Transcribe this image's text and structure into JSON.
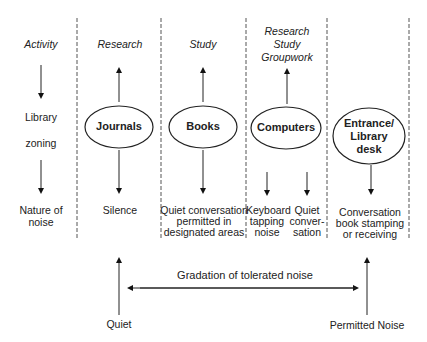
{
  "diagram": {
    "row_labels": {
      "activity": "Activity",
      "library": "Library",
      "zoning": "zoning",
      "nature_of": "Nature of",
      "noise": "noise"
    },
    "columns": [
      {
        "activity": "Research",
        "zone": "Journals",
        "noise": [
          "Silence"
        ]
      },
      {
        "activity": "Study",
        "zone": "Books",
        "noise": [
          "Quiet conversation",
          "permitted in",
          "designated areas"
        ]
      },
      {
        "activity": [
          "Research",
          "Study",
          "Groupwork"
        ],
        "zone": "Computers",
        "noise_a": [
          "Keyboard",
          "tapping",
          "noise"
        ],
        "noise_b": [
          "Quiet",
          "conver-",
          "sation"
        ]
      },
      {
        "zone": [
          "Entrance/",
          "Library",
          "desk"
        ],
        "noise": [
          "Conversation",
          "book stamping",
          "or receiving"
        ]
      }
    ],
    "gradation": {
      "label": "Gradation of tolerated noise",
      "left": "Quiet",
      "right": "Permitted Noise"
    }
  }
}
